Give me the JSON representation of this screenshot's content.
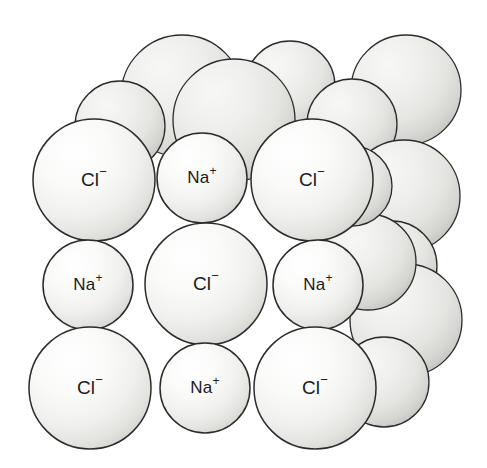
{
  "figure": {
    "background_color": "#ffffff",
    "outline_color": "#2b2b2b"
  },
  "legend_ions": [
    {
      "key": "chloride",
      "label": "Cl",
      "charge": "−",
      "full_label": "Cl⁻",
      "relative_size": "large",
      "radius_px": 61
    },
    {
      "key": "sodium",
      "label": "Na",
      "charge": "+",
      "full_label": "Na⁺",
      "relative_size": "small",
      "radius_px": 45
    }
  ],
  "palette": {
    "front_fill_light": "#ffffff",
    "front_fill_mid": "#f2f2f1",
    "front_fill_edge": "#d9d9d7",
    "back_fill_light": "#f0f0ee",
    "back_fill_mid": "#e2e2df",
    "back_fill_edge": "#c9c9c5",
    "stroke": "#2b2b2b",
    "text": "#1a1a1a"
  },
  "spheres_back": [
    {
      "id": "b1",
      "ion": "chloride",
      "cx": 182,
      "cy": 96,
      "r": 61,
      "label": ""
    },
    {
      "id": "b2",
      "ion": "sodium",
      "cx": 290,
      "cy": 86,
      "r": 45,
      "label": ""
    },
    {
      "id": "b3",
      "ion": "chloride",
      "cx": 406,
      "cy": 90,
      "r": 55,
      "label": ""
    },
    {
      "id": "b4",
      "ion": "sodium",
      "cx": 120,
      "cy": 126,
      "r": 45,
      "label": ""
    },
    {
      "id": "b5",
      "ion": "chloride",
      "cx": 234,
      "cy": 120,
      "r": 61,
      "label": ""
    },
    {
      "id": "b6",
      "ion": "sodium",
      "cx": 352,
      "cy": 124,
      "r": 45,
      "label": ""
    },
    {
      "id": "b7",
      "ion": "chloride",
      "cx": 404,
      "cy": 196,
      "r": 56,
      "label": ""
    },
    {
      "id": "b8",
      "ion": "sodium",
      "cx": 392,
      "cy": 266,
      "r": 45,
      "label": ""
    },
    {
      "id": "b9",
      "ion": "chloride",
      "cx": 406,
      "cy": 320,
      "r": 56,
      "label": ""
    },
    {
      "id": "b10",
      "ion": "sodium",
      "cx": 384,
      "cy": 382,
      "r": 45,
      "label": ""
    },
    {
      "id": "b11",
      "ion": "chloride",
      "cx": 368,
      "cy": 262,
      "r": 48,
      "label": ""
    },
    {
      "id": "b12",
      "ion": "sodium",
      "cx": 352,
      "cy": 186,
      "r": 40,
      "label": ""
    }
  ],
  "spheres_front": [
    {
      "id": "f1",
      "ion": "chloride",
      "cx": 94,
      "cy": 180,
      "r": 61,
      "label": "Cl⁻",
      "row": 1,
      "col": 1
    },
    {
      "id": "f2",
      "ion": "sodium",
      "cx": 202,
      "cy": 178,
      "r": 45,
      "label": "Na⁺",
      "row": 1,
      "col": 2
    },
    {
      "id": "f3",
      "ion": "chloride",
      "cx": 312,
      "cy": 180,
      "r": 61,
      "label": "Cl⁻",
      "row": 1,
      "col": 3
    },
    {
      "id": "f4",
      "ion": "sodium",
      "cx": 88,
      "cy": 285,
      "r": 45,
      "label": "Na⁺",
      "row": 2,
      "col": 1
    },
    {
      "id": "f5",
      "ion": "chloride",
      "cx": 206,
      "cy": 284,
      "r": 61,
      "label": "Cl⁻",
      "row": 2,
      "col": 2
    },
    {
      "id": "f6",
      "ion": "sodium",
      "cx": 318,
      "cy": 285,
      "r": 45,
      "label": "Na⁺",
      "row": 2,
      "col": 3
    },
    {
      "id": "f7",
      "ion": "chloride",
      "cx": 90,
      "cy": 388,
      "r": 61,
      "label": "Cl⁻",
      "row": 3,
      "col": 1
    },
    {
      "id": "f8",
      "ion": "sodium",
      "cx": 205,
      "cy": 388,
      "r": 45,
      "label": "Na⁺",
      "row": 3,
      "col": 2
    },
    {
      "id": "f9",
      "ion": "chloride",
      "cx": 315,
      "cy": 388,
      "r": 61,
      "label": "Cl⁻",
      "row": 3,
      "col": 3
    }
  ],
  "label_style": {
    "font_size_large": 19,
    "font_size_small": 17,
    "charge_font_size_large": 13,
    "charge_font_size_small": 12
  }
}
